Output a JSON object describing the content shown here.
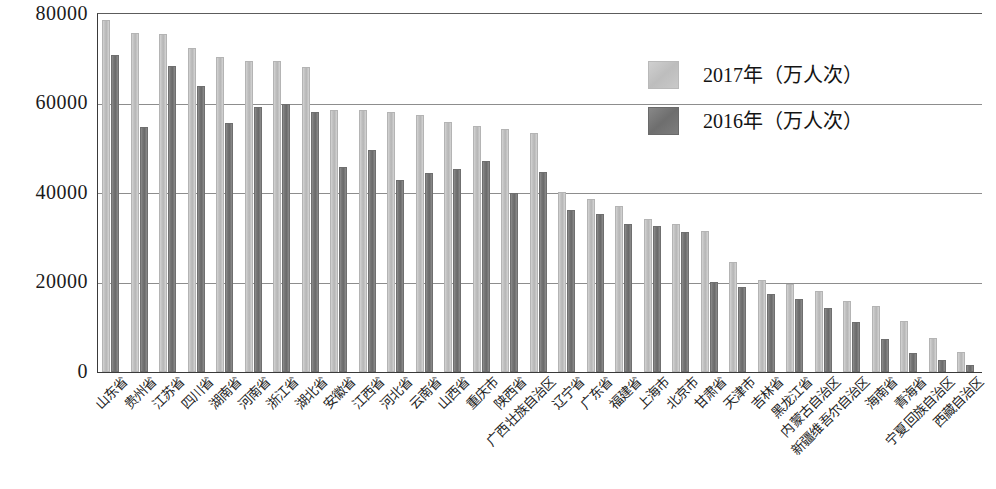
{
  "chart_data": {
    "type": "bar",
    "title": "",
    "xlabel": "",
    "ylabel": "",
    "ylim": [
      0,
      80000
    ],
    "yticks": [
      0,
      20000,
      40000,
      60000,
      80000
    ],
    "ytick_labels": [
      "0",
      "20000",
      "40000",
      "60000",
      "80000"
    ],
    "grid": true,
    "legend_position": "top-right",
    "unit": "万人次",
    "categories": [
      "山东省",
      "贵州省",
      "江苏省",
      "四川省",
      "湖南省",
      "河南省",
      "浙江省",
      "湖北省",
      "安徽省",
      "江西省",
      "河北省",
      "云南省",
      "山西省",
      "重庆市",
      "陕西省",
      "广西壮族自治区",
      "辽宁省",
      "广东省",
      "福建省",
      "上海市",
      "北京市",
      "甘肃省",
      "天津市",
      "吉林省",
      "黑龙江省",
      "内蒙古自治区",
      "新疆维吾尔自治区",
      "海南省",
      "青海省",
      "宁夏回族自治区",
      "西藏自治区"
    ],
    "series": [
      {
        "name": "2017年（万人次）",
        "color": "#c4c4c4",
        "values": [
          78700,
          75800,
          75600,
          72300,
          70400,
          69500,
          69400,
          68200,
          58600,
          58500,
          58200,
          57400,
          55800,
          54900,
          54400,
          53400,
          40300,
          38700,
          37000,
          34300,
          33000,
          31500,
          24500,
          20600,
          19600,
          18100,
          15900,
          14800,
          11400,
          7600,
          4500
        ]
      },
      {
        "name": "2016年（万人次）",
        "color": "#777777",
        "values": [
          70900,
          54800,
          68400,
          63900,
          55700,
          59200,
          59800,
          58200,
          45900,
          49600,
          42900,
          44400,
          45300,
          47100,
          40000,
          44700,
          36200,
          35200,
          33000,
          32600,
          31200,
          20200,
          19000,
          17500,
          16300,
          14200,
          11100,
          7400,
          4300,
          2700,
          1600
        ]
      }
    ]
  },
  "legend": {
    "items": [
      {
        "label": "2017年（万人次）",
        "swatch": "light-gray"
      },
      {
        "label": "2016年（万人次）",
        "swatch": "dark-gray"
      }
    ]
  },
  "axis": {
    "y_tick_labels": [
      "80000",
      "60000",
      "40000",
      "20000",
      "0"
    ]
  }
}
